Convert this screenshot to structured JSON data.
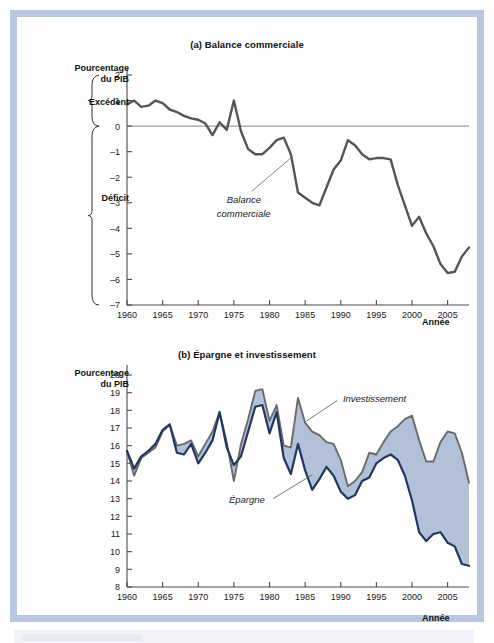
{
  "figure": {
    "frame_color": "#b9c6e0",
    "background": "#ffffff"
  },
  "panel_a": {
    "title": "(a) Balance commerciale",
    "y_caption_line1": "Pourcentage",
    "y_caption_line2": "du PIB",
    "bracket_upper_label": "Excédent",
    "bracket_lower_label": "Déficit",
    "x_axis_label": "Année",
    "series_annotation_line1": "Balance",
    "series_annotation_line2": "commerciale",
    "line_color": "#555555"
  },
  "panel_b": {
    "title": "(b) Épargne et investissement",
    "y_caption_line1": "Pourcentage",
    "y_caption_line2": "du PIB",
    "x_axis_label": "Année",
    "annotation_investment": "Investissement",
    "annotation_saving": "Épargne",
    "investment_color": "#6b6b6b",
    "saving_color": "#1f3864",
    "fill_color": "#aebdd6"
  },
  "chart_data": [
    {
      "type": "line",
      "id": "balance-commerciale",
      "title": "(a) Balance commerciale",
      "xlabel": "Année",
      "ylabel": "Pourcentage du PIB",
      "xlim": [
        1960,
        2008
      ],
      "ylim": [
        -7,
        2
      ],
      "yticks": [
        2,
        1,
        0,
        -1,
        -2,
        -3,
        -4,
        -5,
        -6,
        -7
      ],
      "ytick_labels": [
        "2",
        "1",
        "0",
        "-1",
        "-2",
        "-3",
        "-4",
        "-5",
        "-6",
        "-7"
      ],
      "xticks": [
        1960,
        1965,
        1970,
        1975,
        1980,
        1985,
        1990,
        1995,
        2000,
        2005
      ],
      "xtick_labels": [
        "1960",
        "1965",
        "1970",
        "1975",
        "1980",
        "1985",
        "1990",
        "1995",
        "2000",
        "2005"
      ],
      "grid": false,
      "legend": "none",
      "annotations": [
        "Balance commerciale",
        "Excédent",
        "Déficit"
      ],
      "x": [
        1960,
        1961,
        1962,
        1963,
        1964,
        1965,
        1966,
        1967,
        1968,
        1969,
        1970,
        1971,
        1972,
        1973,
        1974,
        1975,
        1976,
        1977,
        1978,
        1979,
        1980,
        1981,
        1982,
        1983,
        1984,
        1985,
        1986,
        1987,
        1988,
        1989,
        1990,
        1991,
        1992,
        1993,
        1994,
        1995,
        1996,
        1997,
        1998,
        1999,
        2000,
        2001,
        2002,
        2003,
        2004,
        2005,
        2006,
        2007,
        2008
      ],
      "series": [
        {
          "name": "Balance commerciale",
          "values": [
            0.85,
            1.0,
            0.75,
            0.8,
            1.0,
            0.9,
            0.65,
            0.55,
            0.4,
            0.3,
            0.25,
            0.1,
            -0.35,
            0.15,
            -0.15,
            1.0,
            -0.2,
            -0.9,
            -1.1,
            -1.1,
            -0.85,
            -0.55,
            -0.45,
            -1.1,
            -2.6,
            -2.8,
            -3.0,
            -3.1,
            -2.4,
            -1.7,
            -1.35,
            -0.55,
            -0.75,
            -1.1,
            -1.3,
            -1.25,
            -1.25,
            -1.3,
            -2.3,
            -3.1,
            -3.9,
            -3.55,
            -4.2,
            -4.7,
            -5.4,
            -5.75,
            -5.7,
            -5.1,
            -4.75
          ]
        }
      ]
    },
    {
      "type": "area",
      "id": "epargne-investissement",
      "title": "(b) Épargne et investissement",
      "xlabel": "Année",
      "ylabel": "Pourcentage du PIB",
      "xlim": [
        1960,
        2008
      ],
      "ylim": [
        8,
        20
      ],
      "yticks": [
        20,
        19,
        18,
        17,
        16,
        15,
        14,
        13,
        12,
        11,
        10,
        9,
        8
      ],
      "ytick_labels": [
        "20",
        "19",
        "18",
        "17",
        "16",
        "15",
        "14",
        "13",
        "12",
        "11",
        "10",
        "9",
        "8"
      ],
      "xticks": [
        1960,
        1965,
        1970,
        1975,
        1980,
        1985,
        1990,
        1995,
        2000,
        2005
      ],
      "xtick_labels": [
        "1960",
        "1965",
        "1970",
        "1975",
        "1980",
        "1985",
        "1990",
        "1995",
        "2000",
        "2005"
      ],
      "grid": false,
      "legend": "inline-annotation",
      "annotations": [
        "Investissement",
        "Épargne"
      ],
      "x": [
        1960,
        1961,
        1962,
        1963,
        1964,
        1965,
        1966,
        1967,
        1968,
        1969,
        1970,
        1971,
        1972,
        1973,
        1974,
        1975,
        1976,
        1977,
        1978,
        1979,
        1980,
        1981,
        1982,
        1983,
        1984,
        1985,
        1986,
        1987,
        1988,
        1989,
        1990,
        1991,
        1992,
        1993,
        1994,
        1995,
        1996,
        1997,
        1998,
        1999,
        2000,
        2001,
        2002,
        2003,
        2004,
        2005,
        2006,
        2007,
        2008
      ],
      "series": [
        {
          "name": "Investissement",
          "values": [
            15.7,
            14.3,
            15.3,
            15.6,
            15.9,
            16.8,
            17.2,
            16.0,
            16.1,
            16.3,
            15.4,
            16.1,
            16.8,
            17.9,
            16.2,
            14.0,
            16.1,
            17.5,
            19.1,
            19.2,
            17.4,
            18.3,
            16.0,
            15.9,
            18.7,
            17.3,
            16.8,
            16.6,
            16.2,
            16.1,
            15.2,
            13.7,
            14.0,
            14.5,
            15.6,
            15.5,
            16.2,
            16.8,
            17.1,
            17.5,
            17.7,
            16.3,
            15.1,
            15.1,
            16.2,
            16.8,
            16.7,
            15.6,
            13.9
          ]
        },
        {
          "name": "Épargne",
          "values": [
            15.7,
            14.7,
            15.4,
            15.7,
            16.1,
            16.9,
            17.2,
            15.6,
            15.5,
            16.1,
            15.0,
            15.6,
            16.3,
            17.9,
            15.9,
            14.9,
            15.4,
            16.8,
            18.2,
            18.3,
            16.7,
            17.9,
            15.3,
            14.4,
            16.1,
            14.6,
            13.5,
            14.1,
            14.8,
            14.3,
            13.4,
            13.0,
            13.2,
            14.0,
            14.2,
            15.0,
            15.3,
            15.5,
            15.2,
            14.3,
            12.9,
            11.1,
            10.6,
            11.0,
            11.1,
            10.5,
            10.3,
            9.3,
            9.2
          ]
        }
      ]
    }
  ]
}
